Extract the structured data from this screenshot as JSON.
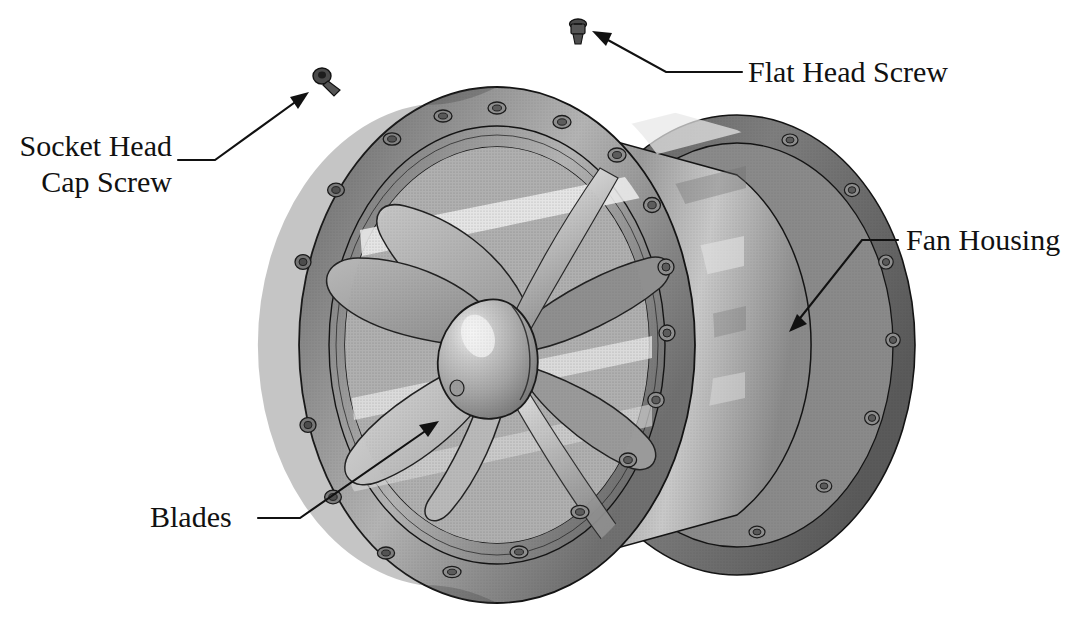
{
  "figure": {
    "background_color": "#ffffff",
    "ink_color": "#111111",
    "style": "shaded technical isometric illustration with callout leaders"
  },
  "callouts": [
    {
      "id": "flat-head-screw",
      "text": "Flat Head Screw",
      "lines": [
        "Flat Head Screw"
      ]
    },
    {
      "id": "socket-head-cap-screw",
      "text": "Socket Head Cap Screw",
      "lines": [
        "Socket Head",
        "Cap Screw"
      ]
    },
    {
      "id": "fan-housing",
      "text": "Fan Housing",
      "lines": [
        "Fan Housing"
      ]
    },
    {
      "id": "blades",
      "text": "Blades",
      "lines": [
        "Blades"
      ]
    }
  ],
  "parts": [
    {
      "id": "fan-housing",
      "name": "Fan Housing"
    },
    {
      "id": "blades",
      "name": "Blades"
    },
    {
      "id": "hub-nose-cone",
      "name": "Hub Nose Cone"
    },
    {
      "id": "flat-head-screw",
      "name": "Flat Head Screw"
    },
    {
      "id": "socket-head-cap-screw",
      "name": "Socket Head Cap Screw"
    }
  ],
  "colors": {
    "ink": "#111111",
    "metal_light": "#d2d2d2",
    "metal_mid": "#a8a8a8",
    "metal_dark": "#7d7d7d",
    "metal_shadow": "#5e5e5e",
    "highlight": "#f2f2f2"
  },
  "counts": {
    "blades": 6,
    "front_flange_bolt_holes": 16,
    "rear_flange_bolt_holes": 12
  }
}
